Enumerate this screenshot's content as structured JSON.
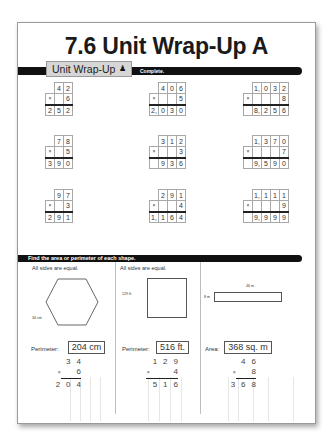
{
  "title": "7.6 Unit Wrap-Up A",
  "tab": {
    "label": "Unit Wrap-Up",
    "icon": "person-icon",
    "subtitle": "Complete."
  },
  "problems": [
    {
      "top": [
        "",
        "4",
        "2"
      ],
      "multiplier": "6",
      "result": [
        "2",
        "5",
        "2"
      ]
    },
    {
      "top": [
        "",
        "4",
        "0",
        "6"
      ],
      "multiplier": "5",
      "result": [
        "2,",
        "0",
        "3",
        "0"
      ]
    },
    {
      "top": [
        "",
        "1,",
        "0",
        "3",
        "2"
      ],
      "multiplier": "8",
      "result": [
        "",
        "8,",
        "2",
        "5",
        "6"
      ]
    },
    {
      "top": [
        "",
        "7",
        "8"
      ],
      "multiplier": "5",
      "result": [
        "3",
        "9",
        "0"
      ]
    },
    {
      "top": [
        "",
        "3",
        "1",
        "2"
      ],
      "multiplier": "3",
      "result": [
        "",
        "9",
        "3",
        "6"
      ]
    },
    {
      "top": [
        "",
        "1,",
        "3",
        "7",
        "0"
      ],
      "multiplier": "7",
      "result": [
        "",
        "9,",
        "5",
        "9",
        "0"
      ]
    },
    {
      "top": [
        "",
        "9",
        "7"
      ],
      "multiplier": "3",
      "result": [
        "2",
        "9",
        "1"
      ]
    },
    {
      "top": [
        "",
        "2",
        "9",
        "1"
      ],
      "multiplier": "4",
      "result": [
        "1,",
        "1",
        "6",
        "4"
      ]
    },
    {
      "top": [
        "",
        "1,",
        "1",
        "1",
        "1"
      ],
      "multiplier": "9",
      "result": [
        "",
        "9,",
        "9",
        "9",
        "9"
      ]
    }
  ],
  "section2": {
    "instruction": "Find the area or perimeter of each shape.",
    "shapes": [
      {
        "caption": "All sides are equal.",
        "shape": "hexagon",
        "side_label": "34 cm",
        "answer_label": "Perimeter:",
        "answer": "204 cm",
        "work": {
          "top": [
            "3",
            "4"
          ],
          "mult": "6",
          "result": [
            "2",
            "0",
            "4"
          ]
        }
      },
      {
        "caption": "All sides are equal.",
        "shape": "square",
        "side_label": "129 ft.",
        "answer_label": "Perimeter:",
        "answer": "516 ft.",
        "work": {
          "top": [
            "1",
            "2",
            "9"
          ],
          "mult": "4",
          "result": [
            "5",
            "1",
            "6"
          ]
        }
      },
      {
        "caption": "",
        "shape": "rectangle",
        "width_label": "46 m",
        "height_label": "8 m",
        "answer_label": "Area:",
        "answer": "368 sq. m",
        "work": {
          "top": [
            "4",
            "6"
          ],
          "mult": "8",
          "result": [
            "3",
            "6",
            "8"
          ]
        }
      }
    ]
  },
  "symbols": {
    "times": "×"
  }
}
